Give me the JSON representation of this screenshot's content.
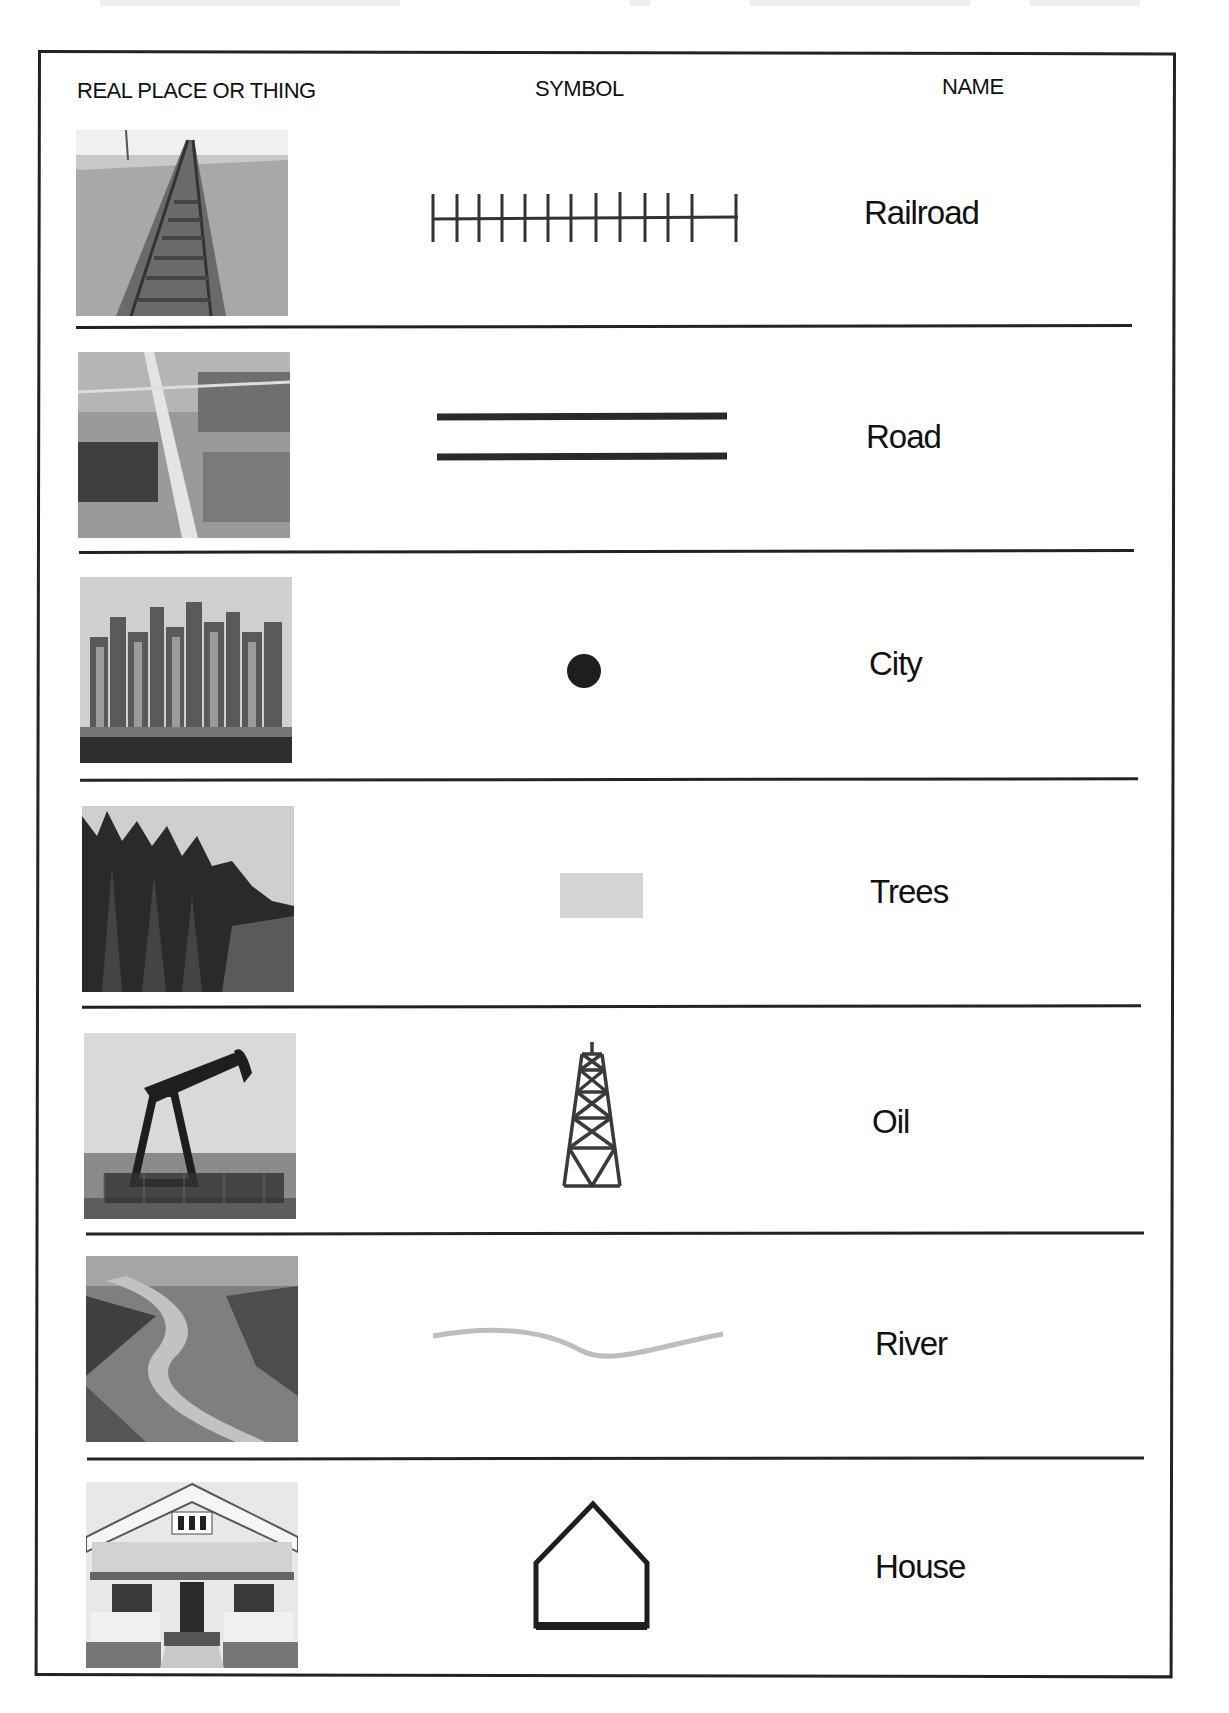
{
  "headers": {
    "col1": "REAL PLACE OR THING",
    "col2": "SYMBOL",
    "col3": "NAME"
  },
  "rows": [
    {
      "name": "Railroad",
      "symbol": "railroad-symbol",
      "photo": "railroad-tracks-photo"
    },
    {
      "name": "Road",
      "symbol": "road-symbol",
      "photo": "aerial-road-photo"
    },
    {
      "name": "City",
      "symbol": "city-dot-symbol",
      "photo": "city-skyline-photo"
    },
    {
      "name": "Trees",
      "symbol": "trees-rect-symbol",
      "photo": "forest-photo"
    },
    {
      "name": "Oil",
      "symbol": "oil-derrick-symbol",
      "photo": "oil-pump-photo"
    },
    {
      "name": "River",
      "symbol": "river-wave-symbol",
      "photo": "river-valley-photo"
    },
    {
      "name": "House",
      "symbol": "house-outline-symbol",
      "photo": "house-photo"
    }
  ],
  "colors": {
    "ink": "#222222",
    "trees_fill": "#d4d4d4",
    "river_stroke": "#bdbdbd"
  }
}
